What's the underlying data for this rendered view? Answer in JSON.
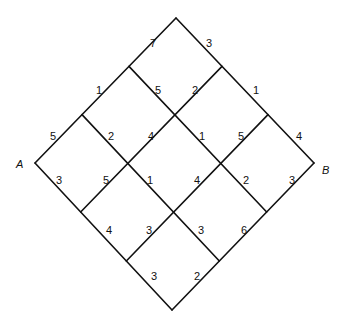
{
  "diagram": {
    "type": "grid-shortest-path",
    "corners": {
      "A": [
        35,
        163
      ],
      "top": [
        176,
        18
      ],
      "B": [
        314,
        163
      ],
      "bottom": [
        172,
        310
      ]
    },
    "grid_size": 3,
    "labels": {
      "start": "A",
      "end": "B"
    },
    "edge_labels": [
      {
        "text": "7",
        "x": 150,
        "y": 47
      },
      {
        "text": "3",
        "x": 206,
        "y": 47
      },
      {
        "text": "1",
        "x": 96,
        "y": 94
      },
      {
        "text": "5",
        "x": 155,
        "y": 94
      },
      {
        "text": "2",
        "x": 192,
        "y": 94
      },
      {
        "text": "1",
        "x": 253,
        "y": 94
      },
      {
        "text": "5",
        "x": 50,
        "y": 140
      },
      {
        "text": "2",
        "x": 108,
        "y": 140
      },
      {
        "text": "4",
        "x": 148,
        "y": 140
      },
      {
        "text": "1",
        "x": 199,
        "y": 140
      },
      {
        "text": "5",
        "x": 238,
        "y": 140
      },
      {
        "text": "4",
        "x": 296,
        "y": 140
      },
      {
        "text": "3",
        "x": 56,
        "y": 184
      },
      {
        "text": "5",
        "x": 103,
        "y": 184
      },
      {
        "text": "1",
        "x": 147,
        "y": 184
      },
      {
        "text": "4",
        "x": 194,
        "y": 184
      },
      {
        "text": "2",
        "x": 243,
        "y": 184
      },
      {
        "text": "3",
        "x": 289,
        "y": 184
      },
      {
        "text": "4",
        "x": 106,
        "y": 234
      },
      {
        "text": "3",
        "x": 146,
        "y": 234
      },
      {
        "text": "3",
        "x": 198,
        "y": 234
      },
      {
        "text": "6",
        "x": 241,
        "y": 234
      },
      {
        "text": "3",
        "x": 151,
        "y": 280
      },
      {
        "text": "2",
        "x": 194,
        "y": 280
      }
    ]
  }
}
